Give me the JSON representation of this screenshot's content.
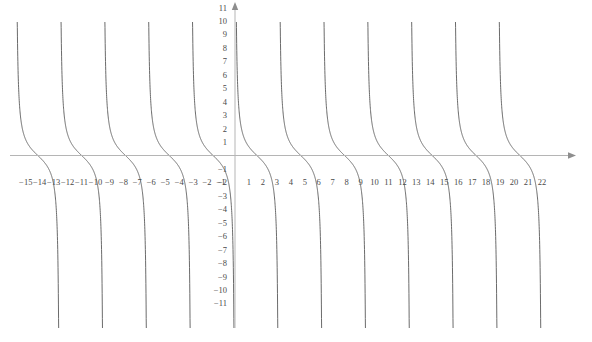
{
  "chart_data": {
    "type": "line",
    "title": "",
    "subtitle": "",
    "xlabel": "",
    "ylabel": "",
    "function": "cot(x)",
    "grid": false,
    "legend": null,
    "xlim": [
      -15.8,
      23.8
    ],
    "ylim": [
      -11.8,
      12.2
    ],
    "period": 3.14159265,
    "asymptotes": [
      -15.70796,
      -12.56637,
      -9.42478,
      -6.28319,
      -3.14159,
      0,
      3.14159,
      6.28319,
      9.42478,
      12.56637,
      15.70796,
      18.84956,
      21.99115
    ],
    "zero_crossings": [
      -14.13717,
      -10.99557,
      -7.85398,
      -4.71239,
      -1.5708,
      1.5708,
      4.71239,
      7.85398,
      10.99557,
      14.13717,
      17.27876,
      20.42035
    ],
    "x_ticks": [
      -15,
      -14,
      -13,
      -12,
      -11,
      -10,
      -9,
      -8,
      -7,
      -6,
      -5,
      -4,
      -3,
      -2,
      -1,
      1,
      2,
      3,
      4,
      5,
      6,
      7,
      8,
      9,
      10,
      11,
      12,
      13,
      14,
      15,
      16,
      17,
      18,
      19,
      20,
      21,
      22
    ],
    "x_tick_labels": [
      "−15",
      "−14",
      "−13",
      "−12",
      "−11",
      "−10",
      "−9",
      "−8",
      "−7",
      "−6",
      "−5",
      "−4",
      "−3",
      "−2",
      "−1",
      "1",
      "2",
      "3",
      "4",
      "5",
      "6",
      "7",
      "8",
      "9",
      "10",
      "11",
      "12",
      "13",
      "14",
      "15",
      "16",
      "17",
      "18",
      "19",
      "20",
      "21",
      "22"
    ],
    "y_ticks": [
      11,
      10,
      9,
      8,
      7,
      6,
      5,
      4,
      3,
      2,
      1,
      -1,
      -2,
      -3,
      -4,
      -5,
      -6,
      -7,
      -8,
      -9,
      -10,
      -11
    ],
    "y_tick_labels": [
      "11",
      "10",
      "9",
      "8",
      "7",
      "6",
      "5",
      "4",
      "3",
      "2",
      "1",
      "−1",
      "−2",
      "−3",
      "−4",
      "−5",
      "−6",
      "−7",
      "−8",
      "−9",
      "−10",
      "−11"
    ],
    "colors": {
      "curve": "#5a5a5a",
      "axis": "#b5b5b5",
      "label": "#4a4a4a",
      "background": "#ffffff"
    }
  },
  "axes": {
    "x_axis_name": "x-axis",
    "y_axis_name": "y-axis",
    "x_arrow": "right-arrow",
    "y_arrow": "up-arrow"
  }
}
